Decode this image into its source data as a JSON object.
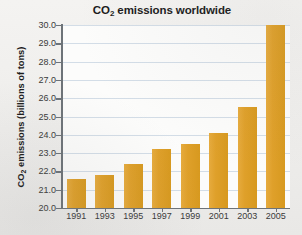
{
  "chart_data": {
    "type": "bar",
    "title": "CO2 emissions worldwide",
    "title_parts": {
      "prefix": "CO",
      "sub": "2",
      "suffix": " emissions worldwide"
    },
    "xlabel": "",
    "ylabel": "CO2 emissions (billions of tons)",
    "ylabel_parts": {
      "prefix": "CO",
      "sub": "2",
      "suffix": " emissions (billions of tons)"
    },
    "categories": [
      "1991",
      "1993",
      "1995",
      "1997",
      "1999",
      "2001",
      "2003",
      "2005"
    ],
    "values": [
      21.6,
      21.8,
      22.4,
      23.2,
      23.5,
      24.1,
      25.5,
      30.0
    ],
    "ylim": [
      20.0,
      30.0
    ],
    "ytick_labels": [
      "30.0",
      "29.0",
      "28.0",
      "27.0",
      "26.0",
      "25.0",
      "24.0",
      "23.0",
      "22.0",
      "21.0",
      "20.0"
    ],
    "ytick_values": [
      30.0,
      29.0,
      28.0,
      27.0,
      26.0,
      25.0,
      24.0,
      23.0,
      22.0,
      21.0,
      20.0
    ],
    "grid": true,
    "legend": false,
    "bar_color": "#DFA02A",
    "grid_color": "#D3DDE7",
    "axis_color": "#6D7378",
    "plot_background": "#FCFCFB",
    "figure_background": "#F0EFED"
  }
}
